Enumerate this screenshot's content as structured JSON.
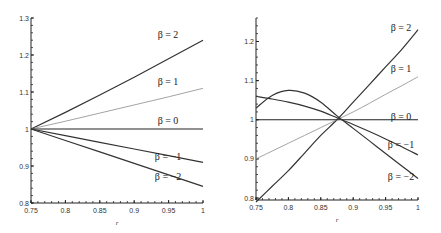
{
  "chart_data": [
    {
      "type": "line",
      "title": "",
      "xlabel": "r",
      "ylabel": "",
      "xlim": [
        0.75,
        1.0
      ],
      "ylim": [
        0.8,
        1.3
      ],
      "grid": false,
      "xticks": [
        "0.75",
        "0.8",
        "0.85",
        "0.9",
        "0.95",
        "1"
      ],
      "yticks": [
        "0.8",
        "0.9",
        "1",
        "1.1",
        "1.2",
        "1.3"
      ],
      "legend_position": "inline labels at right end of curves",
      "x": [
        0.75,
        0.8,
        0.85,
        0.9,
        0.95,
        1.0
      ],
      "series": [
        {
          "name": "β = 2",
          "label": "β = 2",
          "color": "#333333",
          "values": [
            1.0,
            1.045,
            1.092,
            1.14,
            1.19,
            1.24
          ]
        },
        {
          "name": "β = 1",
          "label": "β = 1",
          "color": "#999999",
          "values": [
            1.0,
            1.021,
            1.043,
            1.065,
            1.087,
            1.11
          ]
        },
        {
          "name": "β = 0",
          "label": "β = 0",
          "color": "#222222",
          "values": [
            1.0,
            1.0,
            1.0,
            1.0,
            1.0,
            1.0
          ]
        },
        {
          "name": "β = -1",
          "label": "β = −1",
          "color": "#333333",
          "values": [
            1.0,
            0.982,
            0.964,
            0.946,
            0.928,
            0.91
          ]
        },
        {
          "name": "β = -2",
          "label": "β = −2",
          "color": "#333333",
          "values": [
            1.0,
            0.969,
            0.938,
            0.907,
            0.876,
            0.845
          ]
        }
      ]
    },
    {
      "type": "line",
      "title": "",
      "xlabel": "r",
      "ylabel": "",
      "xlim": [
        0.75,
        1.0
      ],
      "ylim": [
        0.79,
        1.25
      ],
      "grid": false,
      "xticks": [
        "0.75",
        "0.8",
        "0.85",
        "0.9",
        "0.95",
        "1"
      ],
      "yticks": [
        "0.8",
        "0.9",
        "1",
        "1.1",
        "1.2"
      ],
      "legend_position": "inline labels at right end of curves",
      "x": [
        0.75,
        0.775,
        0.8,
        0.825,
        0.85,
        0.875,
        0.9,
        0.925,
        0.95,
        0.975,
        1.0
      ],
      "series": [
        {
          "name": "β = 2",
          "label": "β = 2",
          "color": "#333333",
          "values": [
            0.79,
            0.83,
            0.87,
            0.915,
            0.96,
            1.0,
            1.045,
            1.09,
            1.135,
            1.18,
            1.23
          ]
        },
        {
          "name": "β = 1",
          "label": "β = 1",
          "color": "#999999",
          "values": [
            0.9,
            0.92,
            0.94,
            0.96,
            0.98,
            1.0,
            1.02,
            1.042,
            1.065,
            1.087,
            1.11
          ]
        },
        {
          "name": "β = 0",
          "label": "β = 0",
          "color": "#222222",
          "values": [
            1.0,
            1.0,
            1.0,
            1.0,
            1.0,
            1.0,
            1.0,
            1.0,
            1.0,
            1.0,
            1.0
          ]
        },
        {
          "name": "β = -1",
          "label": "β = −1",
          "color": "#333333",
          "values": [
            1.06,
            1.053,
            1.045,
            1.035,
            1.022,
            1.005,
            0.988,
            0.97,
            0.951,
            0.931,
            0.91
          ]
        },
        {
          "name": "β = -2",
          "label": "β = −2",
          "color": "#333333",
          "values": [
            1.03,
            1.062,
            1.075,
            1.068,
            1.045,
            1.01,
            0.978,
            0.946,
            0.914,
            0.882,
            0.85
          ]
        }
      ]
    }
  ]
}
